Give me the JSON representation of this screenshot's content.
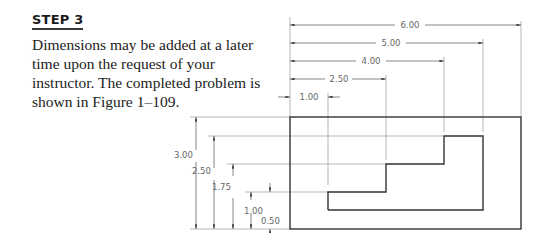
{
  "step": {
    "heading": "STEP 3",
    "body": "Dimensions may be added at a later time upon the request of your instructor. The completed problem is shown in Figure 1–109."
  },
  "drawing": {
    "units_scale_px": {
      "x": 38.5,
      "y": 37.3
    },
    "horizontal_dimensions": [
      {
        "label": "6.00",
        "value": 6.0
      },
      {
        "label": "5.00",
        "value": 5.0
      },
      {
        "label": "4.00",
        "value": 4.0
      },
      {
        "label": "2.50",
        "value": 2.5
      },
      {
        "label": "1.00",
        "value": 1.0
      }
    ],
    "vertical_dimensions": [
      {
        "label": "3.00",
        "value": 3.0
      },
      {
        "label": "2.50",
        "value": 2.5
      },
      {
        "label": "1.75",
        "value": 1.75
      },
      {
        "label": "1.00",
        "value": 1.0
      },
      {
        "label": "0.50",
        "value": 0.5
      }
    ],
    "outer_rect": {
      "width": 6.0,
      "height": 3.0
    },
    "stepped_profile_points": [
      [
        1.0,
        0.5
      ],
      [
        5.0,
        0.5
      ],
      [
        5.0,
        2.5
      ],
      [
        4.0,
        2.5
      ],
      [
        4.0,
        1.75
      ],
      [
        2.5,
        1.75
      ],
      [
        2.5,
        1.0
      ],
      [
        1.0,
        1.0
      ]
    ]
  }
}
